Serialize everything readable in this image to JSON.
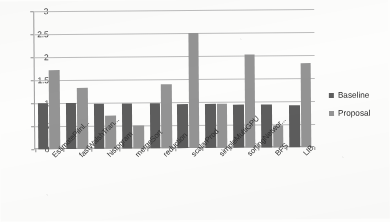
{
  "chart_data": {
    "type": "bar",
    "title": "",
    "subtitle": "",
    "xlabel": "",
    "ylabel": "",
    "ylim": [
      0,
      3
    ],
    "yticks": [
      "0",
      "0.5",
      "1",
      "1.5",
      "2",
      "2.5",
      "3"
    ],
    "grid": true,
    "legend_position": "right",
    "categories": [
      "EstimatePiInl...",
      "fastWalshTran...",
      "histogram",
      "mergeSort",
      "reduction",
      "scalarProd",
      "simpleMultiGPU",
      "sortingNetwor...",
      "BFS",
      "LIB"
    ],
    "series": [
      {
        "name": "Baseline",
        "color": "#5d5d5d",
        "values": [
          1.0,
          1.0,
          0.98,
          0.97,
          0.97,
          0.96,
          0.95,
          0.94,
          0.93,
          0.92
        ]
      },
      {
        "name": "Proposal",
        "color": "#949494",
        "values": [
          1.72,
          1.32,
          0.72,
          0.49,
          1.39,
          2.51,
          0.96,
          2.03,
          0.48,
          1.82
        ]
      }
    ]
  },
  "legend": {
    "items": [
      {
        "label": "Baseline",
        "marker": "legend-swatch-baseline"
      },
      {
        "label": "Proposal",
        "marker": "legend-swatch-proposal"
      }
    ]
  }
}
